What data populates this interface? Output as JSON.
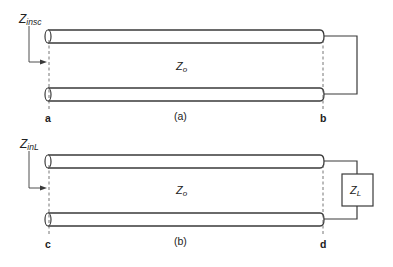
{
  "diagram": {
    "colors": {
      "line": "#3a3a3a",
      "dash": "#666666",
      "text": "#222222",
      "background": "#ffffff"
    },
    "panel_a": {
      "input_label_main": "Z",
      "input_label_sub": "insc",
      "line_impedance_main": "Z",
      "line_impedance_sub": "o",
      "caption": "(a)",
      "left_terminal": "a",
      "right_terminal": "b",
      "termination": "short-circuit"
    },
    "panel_b": {
      "input_label_main": "Z",
      "input_label_sub": "inL",
      "line_impedance_main": "Z",
      "line_impedance_sub": "o",
      "caption": "(b)",
      "left_terminal": "c",
      "right_terminal": "d",
      "load_label_main": "Z",
      "load_label_sub": "L",
      "termination": "load"
    }
  }
}
